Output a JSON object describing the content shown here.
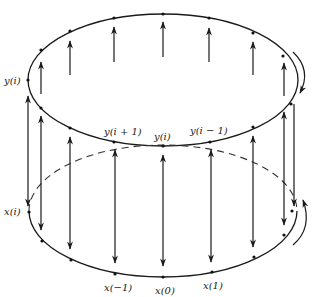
{
  "diagram": {
    "colors": {
      "stroke": "#1a1a1a",
      "background": "#ffffff"
    },
    "upper_ring": {
      "labels": {
        "left": "y(i)",
        "front_left": "y(i + 1)",
        "front_center": "y(i)",
        "front_right": "y(i − 1)"
      }
    },
    "lower_ring": {
      "labels": {
        "left": "x(i)",
        "front_left": "x(−1)",
        "front_center": "x(0)",
        "front_right": "x(1)"
      }
    },
    "rotation_arrows": [
      "clockwise-top-right",
      "counterclockwise-bottom-right"
    ]
  }
}
